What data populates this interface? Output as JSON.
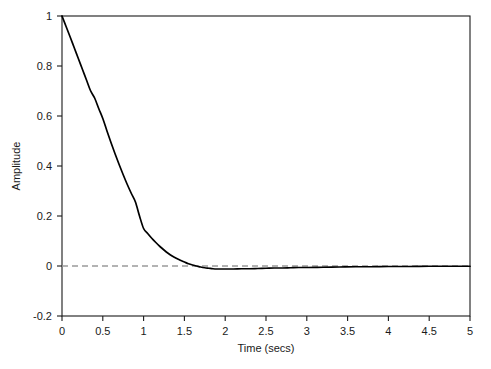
{
  "chart_data": {
    "type": "line",
    "title": "",
    "xlabel": "Time (secs)",
    "ylabel": "Amplitude",
    "xlim": [
      0,
      5
    ],
    "ylim": [
      -0.2,
      1
    ],
    "grid": false,
    "legend": null,
    "xticks": [
      0,
      0.5,
      1,
      1.5,
      2,
      2.5,
      3,
      3.5,
      4,
      4.5,
      5
    ],
    "xtick_labels": [
      "0",
      "0.5",
      "1",
      "1.5",
      "2",
      "2.5",
      "3",
      "3.5",
      "4",
      "4.5",
      "5"
    ],
    "yticks": [
      -0.2,
      0,
      0.2,
      0.4,
      0.6,
      0.8,
      1
    ],
    "ytick_labels": [
      "-0.2",
      "0",
      "0.2",
      "0.4",
      "0.6",
      "0.8",
      "1"
    ],
    "reference_lines": [
      {
        "name": "zero-line",
        "orientation": "horizontal",
        "value": 0,
        "style": "dashed",
        "color": "#9a9a9a"
      }
    ],
    "series": [
      {
        "name": "impulse-response",
        "color": "#000000",
        "style": "solid",
        "x": [
          0,
          0.05,
          0.1,
          0.15,
          0.2,
          0.25,
          0.3,
          0.35,
          0.4,
          0.45,
          0.5,
          0.55,
          0.6,
          0.65,
          0.7,
          0.75,
          0.8,
          0.85,
          0.9,
          0.95,
          1.0,
          1.05,
          1.1,
          1.15,
          1.2,
          1.25,
          1.3,
          1.35,
          1.4,
          1.45,
          1.5,
          1.55,
          1.6,
          1.65,
          1.7,
          1.75,
          1.8,
          1.85,
          1.9,
          1.95,
          2.0,
          2.1,
          2.2,
          2.3,
          2.4,
          2.5,
          2.6,
          2.7,
          2.8,
          2.9,
          3.0,
          3.2,
          3.4,
          3.6,
          3.8,
          4.0,
          4.25,
          4.5,
          4.75,
          5.0
        ],
        "y": [
          1.0,
          0.958,
          0.916,
          0.873,
          0.83,
          0.787,
          0.744,
          0.701,
          0.672,
          0.63,
          0.59,
          0.541,
          0.494,
          0.449,
          0.406,
          0.365,
          0.326,
          0.29,
          0.256,
          0.2,
          0.15,
          0.13,
          0.111,
          0.094,
          0.078,
          0.064,
          0.051,
          0.04,
          0.031,
          0.023,
          0.016,
          0.009,
          0.004,
          0.0,
          -0.004,
          -0.007,
          -0.009,
          -0.011,
          -0.012,
          -0.012,
          -0.012,
          -0.012,
          -0.011,
          -0.011,
          -0.01,
          -0.009,
          -0.008,
          -0.008,
          -0.007,
          -0.006,
          -0.006,
          -0.005,
          -0.004,
          -0.003,
          -0.003,
          -0.002,
          -0.002,
          -0.001,
          -0.001,
          -0.001
        ]
      }
    ]
  },
  "plot_geometry": {
    "left": 62,
    "right": 470,
    "top": 16,
    "bottom": 316
  }
}
